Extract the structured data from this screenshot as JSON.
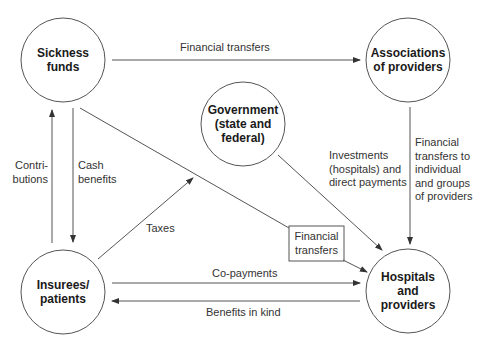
{
  "nodes": {
    "sickness_funds": {
      "line1": "Sickness",
      "line2": "funds"
    },
    "associations": {
      "line1": "Associations",
      "line2": "of providers"
    },
    "government": {
      "line1": "Government",
      "line2": "(state and",
      "line3": "federal)"
    },
    "insurees": {
      "line1": "Insurees/",
      "line2": "patients"
    },
    "hospitals": {
      "line1": "Hospitals",
      "line2": "and",
      "line3": "providers"
    }
  },
  "edges": {
    "funds_to_associations": "Financial transfers",
    "contributions": {
      "line1": "Contri-",
      "line2": "butions"
    },
    "cash_benefits": {
      "line1": "Cash",
      "line2": "benefits"
    },
    "taxes": "Taxes",
    "investments": {
      "line1": "Investments",
      "line2": "(hospitals) and",
      "line3": "direct payments"
    },
    "associations_to_hospitals": {
      "line1": "Financial",
      "line2": "transfers to",
      "line3": "individual",
      "line4": "and groups",
      "line5": "of providers"
    },
    "funds_to_hospitals_box": {
      "line1": "Financial",
      "line2": "transfers"
    },
    "copayments": "Co-payments",
    "benefits_in_kind": "Benefits in kind"
  },
  "colors": {
    "stroke": "#555555",
    "text": "#222222",
    "background": "#ffffff"
  }
}
